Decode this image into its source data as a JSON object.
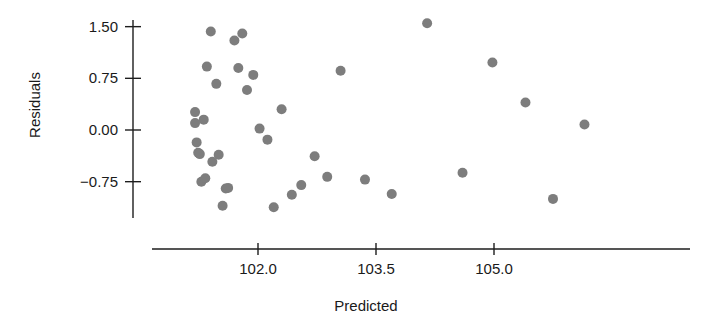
{
  "chart_data": {
    "type": "scatter",
    "title": "",
    "xlabel": "Predicted",
    "ylabel": "Residuals",
    "grid": false,
    "legend": "none",
    "marker": {
      "shape": "circle",
      "color": "#7d7d7d",
      "size_px": 10
    },
    "xlim": [
      100.9,
      106.6
    ],
    "ylim": [
      -1.35,
      1.75
    ],
    "xticks": [
      102.0,
      103.5,
      105.0
    ],
    "xtick_labels": [
      "102.0",
      "103.5",
      "105.0"
    ],
    "yticks": [
      1.5,
      0.75,
      0.0,
      -0.75
    ],
    "ytick_labels": [
      "1.50",
      "0.75",
      "0.00",
      "-0.75"
    ],
    "x": [
      101.2,
      101.2,
      101.22,
      101.24,
      101.26,
      101.28,
      101.31,
      101.33,
      101.35,
      101.4,
      101.42,
      101.47,
      101.5,
      101.55,
      101.59,
      101.62,
      101.7,
      101.75,
      101.8,
      101.86,
      101.94,
      102.02,
      102.12,
      102.2,
      102.3,
      102.43,
      102.55,
      102.72,
      102.88,
      103.05,
      103.36,
      103.7,
      104.15,
      104.6,
      104.98,
      105.4,
      105.75,
      106.15
    ],
    "y": [
      0.26,
      0.1,
      -0.18,
      -0.33,
      -0.35,
      -0.75,
      0.15,
      -0.7,
      0.92,
      1.43,
      -0.46,
      0.67,
      -0.36,
      -1.1,
      -0.85,
      -0.84,
      1.3,
      0.9,
      1.4,
      0.58,
      0.8,
      0.02,
      -0.14,
      -1.12,
      0.3,
      -0.94,
      -0.8,
      -0.38,
      -0.68,
      0.86,
      -0.72,
      -0.93,
      1.55,
      -0.62,
      0.98,
      0.4,
      -1.0,
      0.08
    ],
    "points": [
      {
        "x": 101.2,
        "y": 0.26
      },
      {
        "x": 101.2,
        "y": 0.1
      },
      {
        "x": 101.22,
        "y": -0.18
      },
      {
        "x": 101.24,
        "y": -0.33
      },
      {
        "x": 101.26,
        "y": -0.35
      },
      {
        "x": 101.28,
        "y": -0.75
      },
      {
        "x": 101.31,
        "y": 0.15
      },
      {
        "x": 101.33,
        "y": -0.7
      },
      {
        "x": 101.35,
        "y": 0.92
      },
      {
        "x": 101.4,
        "y": 1.43
      },
      {
        "x": 101.42,
        "y": -0.46
      },
      {
        "x": 101.47,
        "y": 0.67
      },
      {
        "x": 101.5,
        "y": -0.36
      },
      {
        "x": 101.55,
        "y": -1.1
      },
      {
        "x": 101.59,
        "y": -0.85
      },
      {
        "x": 101.62,
        "y": -0.84
      },
      {
        "x": 101.7,
        "y": 1.3
      },
      {
        "x": 101.75,
        "y": 0.9
      },
      {
        "x": 101.8,
        "y": 1.4
      },
      {
        "x": 101.86,
        "y": 0.58
      },
      {
        "x": 101.94,
        "y": 0.8
      },
      {
        "x": 102.02,
        "y": 0.02
      },
      {
        "x": 102.12,
        "y": -0.14
      },
      {
        "x": 102.2,
        "y": -1.12
      },
      {
        "x": 102.3,
        "y": 0.3
      },
      {
        "x": 102.43,
        "y": -0.94
      },
      {
        "x": 102.55,
        "y": -0.8
      },
      {
        "x": 102.72,
        "y": -0.38
      },
      {
        "x": 102.88,
        "y": -0.68
      },
      {
        "x": 103.05,
        "y": 0.86
      },
      {
        "x": 103.36,
        "y": -0.72
      },
      {
        "x": 103.7,
        "y": -0.93
      },
      {
        "x": 104.15,
        "y": 1.55
      },
      {
        "x": 104.6,
        "y": -0.62
      },
      {
        "x": 104.98,
        "y": 0.98
      },
      {
        "x": 105.4,
        "y": 0.4
      },
      {
        "x": 105.75,
        "y": -1.0
      },
      {
        "x": 106.15,
        "y": 0.08
      }
    ]
  },
  "axes": {
    "x_axis_name": "predicted-axis",
    "y_axis_name": "residuals-axis"
  }
}
